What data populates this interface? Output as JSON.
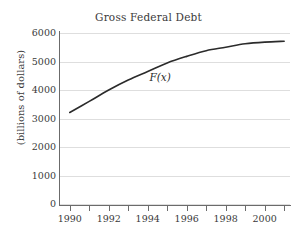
{
  "chart_data": {
    "type": "line",
    "title": "Gross Federal Debt",
    "xlabel": "",
    "ylabel": "(billions of dollars)",
    "series_label": "F(x)",
    "grid": true,
    "legend": "none",
    "xlim": [
      1989.5,
      2001.3
    ],
    "ylim": [
      0,
      6000
    ],
    "xticks": [
      1990,
      1991,
      1992,
      1993,
      1994,
      1995,
      1996,
      1997,
      1998,
      1999,
      2000,
      2001
    ],
    "xtick_labels": [
      "1990",
      "",
      "1992",
      "",
      "1994",
      "",
      "1996",
      "",
      "1998",
      "",
      "2000",
      ""
    ],
    "yticks": [
      0,
      1000,
      2000,
      3000,
      4000,
      5000,
      6000
    ],
    "ytick_labels": [
      "0",
      "1000",
      "2000",
      "3000",
      "4000",
      "5000",
      "6000"
    ],
    "x": [
      1990,
      1991,
      1992,
      1993,
      1994,
      1995,
      1996,
      1997,
      1998,
      1999,
      2000,
      2001
    ],
    "values": [
      3210,
      3600,
      4000,
      4350,
      4650,
      4950,
      5180,
      5380,
      5500,
      5620,
      5680,
      5710
    ],
    "series": [
      {
        "name": "F(x)",
        "values": [
          3210,
          3600,
          4000,
          4350,
          4650,
          4950,
          5180,
          5380,
          5500,
          5620,
          5680,
          5710
        ]
      }
    ],
    "annotations": [
      {
        "text": "F(x)",
        "x": 1994.6,
        "y": 4430
      }
    ],
    "colors": {
      "curve": "#2b2b2b",
      "grid": "#dedede",
      "axis": "#6b6b6b",
      "text": "#3a3a3a",
      "background": "#ffffff"
    }
  }
}
